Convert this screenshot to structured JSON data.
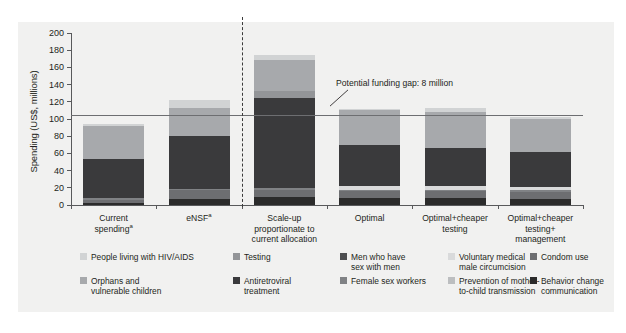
{
  "chart_data": {
    "type": "bar",
    "subtype": "stacked-bar",
    "title": "",
    "xlabel": "",
    "ylabel": "Spending (US$, millions)",
    "ylim": [
      0,
      200
    ],
    "yticks": [
      0,
      20,
      40,
      60,
      80,
      100,
      120,
      140,
      160,
      180,
      200
    ],
    "grid": false,
    "legend_position": "bottom",
    "categories": [
      "Current spendingᵃ",
      "eNSFᵃ",
      "Scale-up proportionate to current allocation",
      "Optimal",
      "Optimal+cheaper testing",
      "Optimal+cheaper testing+ management"
    ],
    "category_label_lines": [
      [
        "Current",
        "spending*"
      ],
      [
        "eNSF*"
      ],
      [
        "Scale-up",
        "proportionate to",
        "current allocation"
      ],
      [
        "Optimal"
      ],
      [
        "Optimal+cheaper",
        "testing"
      ],
      [
        "Optimal+cheaper",
        "testing+",
        "management"
      ]
    ],
    "series": [
      {
        "name": "Behavior change communication",
        "color": "#2b2b2b",
        "values": [
          2.5,
          7.5,
          9.0,
          8.0,
          8.0,
          7.5
        ]
      },
      {
        "name": "Condom use",
        "color": "#6d6e71",
        "values": [
          3.5,
          10.5,
          9.0,
          8.0,
          8.0,
          7.5
        ]
      },
      {
        "name": "Men who have sex with men",
        "color": "#4d4e50",
        "values": [
          0.0,
          0.0,
          0.0,
          0.0,
          0.0,
          0.0
        ]
      },
      {
        "name": "Female sex workers",
        "color": "#808285",
        "values": [
          2.0,
          1.0,
          2.0,
          2.0,
          2.0,
          2.0
        ]
      },
      {
        "name": "Voluntary medical male circumcision",
        "color": "#d9dadb",
        "values": [
          0.0,
          0.0,
          0.0,
          4.0,
          4.0,
          4.0
        ]
      },
      {
        "name": "Prevention of mother-to-child transmission",
        "color": "#bcbec0",
        "values": [
          0.0,
          0.0,
          0.0,
          0.0,
          0.0,
          0.0
        ]
      },
      {
        "name": "Antiretroviral treatment",
        "color": "#3a3a3c",
        "values": [
          45.0,
          61.0,
          105.0,
          48.0,
          44.0,
          41.0
        ]
      },
      {
        "name": "Testing",
        "color": "#939598",
        "values": [
          0.0,
          0.0,
          7.0,
          0.0,
          0.0,
          0.0
        ]
      },
      {
        "name": "Orphans and vulnerable children",
        "color": "#a7a9ac",
        "values": [
          39.0,
          33.0,
          37.0,
          40.0,
          42.0,
          38.0
        ]
      },
      {
        "name": "People living with HIV/AIDS",
        "color": "#d1d3d4",
        "values": [
          2.0,
          9.0,
          6.0,
          2.0,
          5.0,
          2.0
        ]
      }
    ],
    "bar_totals": [
      94,
      122,
      175,
      112,
      113,
      102
    ],
    "reference_line": {
      "value": 105,
      "label": "Potential funding gap: 8 million",
      "color": "#6d6e71"
    },
    "divider": {
      "after_category_index": 1,
      "style": "dashed"
    },
    "annotation": "Potential funding gap: 8 million"
  },
  "axis": {
    "ylabel": "Spending (US$, millions)",
    "yticks": [
      "200",
      "180",
      "160",
      "140",
      "120",
      "100",
      "80",
      "60",
      "40",
      "20",
      "0"
    ]
  },
  "legend": {
    "items": [
      {
        "label": "People living with HIV/AIDS",
        "color": "#d1d3d4"
      },
      {
        "label": "Orphans and\nvulnerable children",
        "color": "#a7a9ac"
      },
      {
        "label": "Testing",
        "color": "#939598"
      },
      {
        "label": "Antiretroviral\ntreatment",
        "color": "#3a3a3c"
      },
      {
        "label": "Men who have\nsex with men",
        "color": "#4d4e50"
      },
      {
        "label": "Female sex workers",
        "color": "#808285"
      },
      {
        "label": "Voluntary medical\nmale circumcision",
        "color": "#d9dadb"
      },
      {
        "label": "Prevention of mother-\nto-child transmission",
        "color": "#bcbec0"
      },
      {
        "label": "Condom use",
        "color": "#6d6e71"
      },
      {
        "label": "Behavior change\ncommunication",
        "color": "#2b2b2b"
      }
    ]
  }
}
